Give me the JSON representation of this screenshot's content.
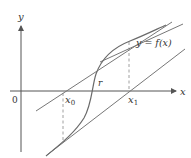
{
  "diagram": {
    "labels": {
      "y_axis": "y",
      "x_axis": "x",
      "origin": "0",
      "x0": "x",
      "x0_sub": "0",
      "x1": "x",
      "x1_sub": "1",
      "root": "r",
      "function": "y = f(x)"
    },
    "colors": {
      "axis": "#555555",
      "curve": "#6a6a6a",
      "tangent": "#777777",
      "dashed": "#888888",
      "text": "#333333"
    }
  }
}
